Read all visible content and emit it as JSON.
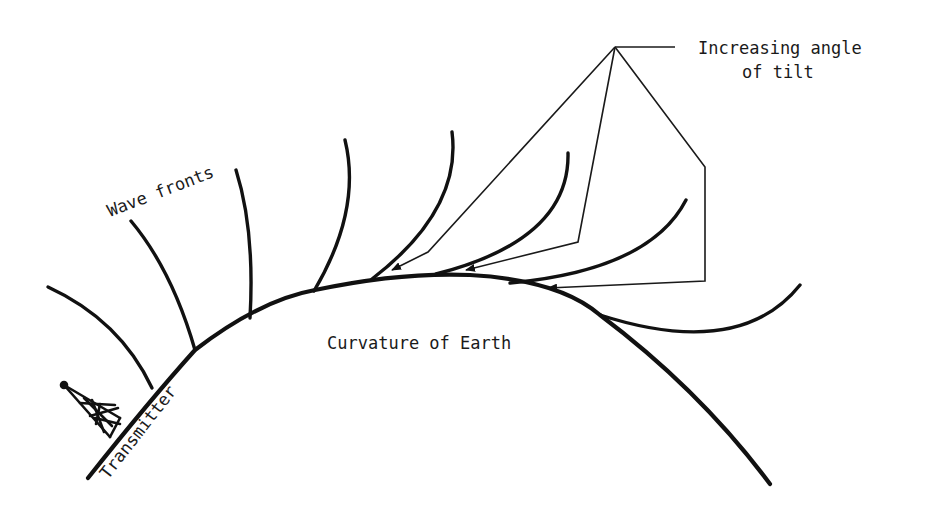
{
  "diagram": {
    "labels": {
      "wave_fronts": "Wave fronts",
      "curvature": "Curvature of Earth",
      "transmitter": "Transmitter",
      "tilt_line1": "Increasing angle",
      "tilt_line2": "of tilt"
    },
    "elements": {
      "earth_surface": "curved arc representing Earth's surface",
      "transmitter": "lattice tower antenna at left end of arc",
      "wave_fronts_count": 8,
      "leader_arrows_count": 3
    },
    "colors": {
      "ink": "#111111",
      "background": "#ffffff"
    }
  }
}
